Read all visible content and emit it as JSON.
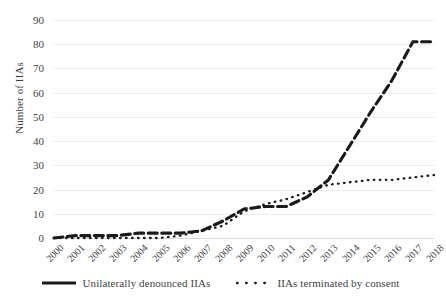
{
  "chart_data": {
    "type": "line",
    "title": "",
    "xlabel": "",
    "ylabel": "Number of IIAs",
    "ylim": [
      0,
      90
    ],
    "ytick_step": 10,
    "grid": true,
    "legend_position": "bottom",
    "categories": [
      "2000",
      "2001",
      "2002",
      "2003",
      "2004",
      "2005",
      "2006",
      "2007",
      "2008",
      "2009",
      "2010",
      "2011",
      "2012",
      "2013",
      "2014",
      "2015",
      "2016",
      "2017",
      "2018"
    ],
    "yticks": [
      "0",
      "10",
      "20",
      "30",
      "40",
      "50",
      "60",
      "70",
      "80",
      "90"
    ],
    "series": [
      {
        "name": "Unilaterally denounced IIAs",
        "style": "thick-dashed",
        "color": "#1a1a1a",
        "values": [
          0,
          1,
          1,
          1,
          2,
          2,
          2,
          3,
          7,
          12,
          13,
          13,
          17,
          24,
          38,
          52,
          65,
          81,
          81
        ]
      },
      {
        "name": "IIAs terminated by consent",
        "style": "dotted",
        "color": "#1a1a1a",
        "values": [
          0,
          0,
          0,
          0,
          0,
          0,
          1,
          3,
          5,
          11,
          14,
          16,
          19,
          22,
          23,
          24,
          24,
          25,
          26
        ]
      }
    ]
  },
  "legend": {
    "items": [
      {
        "label": "Unilaterally denounced IIAs",
        "marker": "dashed-line-swatch"
      },
      {
        "label": "IIAs terminated by consent",
        "marker": "dotted-line-swatch"
      }
    ]
  },
  "axis": {
    "y_title": "Number of IIAs"
  },
  "colors": {
    "series_line": "#1a1a1a",
    "gridline": "#ececed",
    "text": "#3f3f3f",
    "background": "#ffffff"
  }
}
